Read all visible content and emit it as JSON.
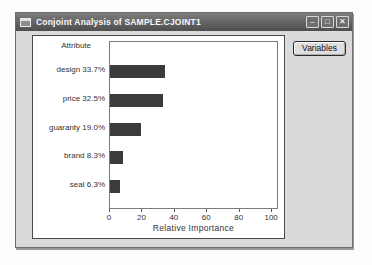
{
  "window": {
    "title": "Conjoint Analysis of SAMPLE.CJOINT1",
    "controls": [
      {
        "name": "minimize",
        "glyph": "–"
      },
      {
        "name": "maximize",
        "glyph": "□"
      },
      {
        "name": "close",
        "glyph": "✕"
      }
    ]
  },
  "buttons": {
    "variables": "Variables"
  },
  "chart_data": {
    "type": "bar",
    "orientation": "horizontal",
    "header": "Attribute",
    "categories": [
      "design",
      "price",
      "guaranty",
      "brand",
      "seal"
    ],
    "values": [
      33.7,
      32.5,
      19.0,
      8.3,
      6.3
    ],
    "value_labels": [
      "33.7%",
      "32.5%",
      "19.0%",
      "8.3%",
      "6.3%"
    ],
    "xlabel": "Relative Importance",
    "xticks": [
      0,
      20,
      40,
      60,
      80,
      100
    ],
    "xlim": [
      0,
      103
    ],
    "grid": false,
    "legend": "none",
    "bar_color": "#3b3b3b"
  }
}
